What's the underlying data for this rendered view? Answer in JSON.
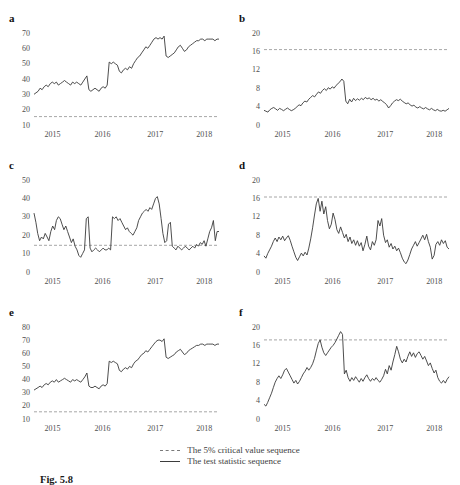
{
  "figure": {
    "x_tick_labels": [
      "2015",
      "2016",
      "2017",
      "2018"
    ],
    "x_tick_fractions": [
      0.1,
      0.37,
      0.655,
      0.92
    ],
    "legend": {
      "items": [
        {
          "style": "dashed",
          "label": "The 5% critical value sequence"
        },
        {
          "style": "solid",
          "label": "The test statistic sequence"
        }
      ]
    },
    "caption": {
      "label": "Fig. 5.8"
    },
    "colors": {
      "series": "#3a3a3a",
      "critical": "#8f8f8f",
      "tick_text": "#4f4f4f",
      "panel_label": "#111111"
    }
  },
  "chart_data": [
    {
      "type": "line",
      "label": "a",
      "x_ticks": [
        "2015",
        "2016",
        "2017",
        "2018"
      ],
      "ylim": [
        10,
        70
      ],
      "yticks": [
        10,
        20,
        30,
        40,
        50,
        60,
        70
      ],
      "critical_value": 15.5,
      "series_name": "The test statistic sequence",
      "values": [
        30,
        31,
        32,
        34,
        33,
        35,
        36,
        35,
        37,
        38,
        37,
        38,
        36,
        37,
        38,
        39,
        38,
        37,
        36,
        38,
        37,
        38,
        37,
        36,
        38,
        40,
        42,
        33,
        32,
        33,
        34,
        33,
        32,
        34,
        35,
        34,
        36,
        51,
        50,
        51,
        50,
        49,
        45,
        44,
        46,
        47,
        46,
        48,
        47,
        50,
        52,
        54,
        55,
        57,
        59,
        61,
        60,
        62,
        64,
        66,
        67,
        66,
        67,
        66,
        68,
        55,
        54,
        55,
        56,
        57,
        59,
        61,
        62,
        60,
        58,
        59,
        61,
        62,
        63,
        64,
        65,
        65,
        66,
        66,
        65,
        66,
        66,
        66,
        66,
        65,
        66,
        66
      ]
    },
    {
      "type": "line",
      "label": "b",
      "x_ticks": [
        "2015",
        "2016",
        "2017",
        "2018"
      ],
      "ylim": [
        0,
        20
      ],
      "yticks": [
        0,
        4,
        8,
        12,
        16,
        20
      ],
      "critical_value": 16.4,
      "series_name": "The test statistic sequence",
      "values": [
        3.2,
        3.0,
        2.8,
        3.3,
        3.6,
        3.8,
        3.5,
        3.2,
        3.6,
        3.4,
        3.1,
        3.4,
        3.7,
        3.4,
        3.1,
        3.3,
        3.6,
        4.0,
        4.4,
        4.2,
        4.8,
        5.2,
        5.0,
        5.6,
        6.0,
        6.4,
        6.1,
        6.7,
        7.2,
        6.9,
        7.5,
        7.9,
        7.5,
        8.1,
        7.8,
        8.3,
        8.0,
        8.6,
        9.0,
        9.4,
        10.0,
        9.5,
        5.2,
        4.6,
        5.6,
        5.0,
        5.8,
        5.3,
        5.7,
        5.4,
        5.8,
        5.5,
        6.0,
        5.7,
        5.9,
        5.5,
        5.8,
        5.4,
        5.6,
        5.2,
        5.5,
        5.1,
        4.8,
        4.4,
        3.7,
        4.2,
        4.8,
        5.2,
        5.5,
        5.3,
        5.6,
        5.2,
        4.9,
        4.6,
        4.8,
        4.4,
        4.1,
        4.3,
        3.9,
        3.7,
        4.0,
        3.7,
        3.5,
        3.8,
        3.5,
        3.3,
        3.6,
        3.3,
        3.1,
        3.4,
        3.1,
        3.0,
        3.2,
        3.0,
        3.3,
        3.6
      ]
    },
    {
      "type": "line",
      "label": "c",
      "x_ticks": [
        "2015",
        "2016",
        "2017",
        "2018"
      ],
      "ylim": [
        0,
        50
      ],
      "yticks": [
        0,
        10,
        20,
        30,
        40,
        50
      ],
      "critical_value": 14.5,
      "series_name": "The test statistic sequence",
      "values": [
        32,
        27,
        21,
        17,
        19,
        18,
        21,
        19,
        17,
        22,
        25,
        23,
        28,
        30,
        29,
        26,
        23,
        25,
        22,
        19,
        16,
        18,
        14,
        12,
        9,
        8,
        10,
        12,
        29,
        30,
        13,
        11,
        12,
        13,
        12,
        11,
        12,
        13,
        12,
        12,
        13,
        12,
        30,
        29,
        30,
        28,
        29,
        27,
        25,
        23,
        24,
        22,
        21,
        20,
        22,
        24,
        28,
        30,
        32,
        33,
        34,
        33,
        35,
        34,
        37,
        40,
        41,
        37,
        29,
        21,
        16,
        17,
        26,
        27,
        14,
        13,
        12,
        14,
        13,
        12,
        13,
        14,
        13,
        12,
        13,
        14,
        13,
        15,
        14,
        16,
        15,
        17,
        14,
        18,
        22,
        24,
        28,
        17,
        22,
        22
      ]
    },
    {
      "type": "line",
      "label": "d",
      "x_ticks": [
        "2015",
        "2016",
        "2017",
        "2018"
      ],
      "ylim": [
        0,
        20
      ],
      "yticks": [
        0,
        4,
        8,
        12,
        16,
        20
      ],
      "critical_value": 16.3,
      "series_name": "The test statistic sequence",
      "values": [
        3.5,
        3.0,
        4.0,
        4.8,
        5.6,
        6.6,
        7.4,
        6.6,
        7.6,
        7.0,
        7.8,
        6.8,
        7.4,
        7.9,
        6.9,
        5.6,
        4.4,
        3.2,
        2.5,
        3.3,
        4.1,
        3.5,
        4.3,
        3.7,
        5.2,
        7.2,
        9.6,
        12.4,
        14.8,
        16.0,
        13.2,
        15.4,
        12.6,
        14.2,
        11.2,
        9.4,
        10.4,
        12.8,
        11.4,
        9.2,
        8.4,
        9.8,
        8.6,
        7.4,
        8.2,
        6.6,
        7.6,
        6.2,
        7.0,
        5.8,
        6.8,
        5.6,
        6.4,
        4.6,
        6.0,
        7.8,
        5.6,
        4.8,
        6.6,
        5.8,
        7.0,
        11.2,
        10.0,
        11.6,
        8.0,
        6.4,
        7.0,
        5.4,
        6.2,
        5.0,
        5.6,
        4.6,
        5.2,
        4.2,
        3.0,
        2.2,
        1.8,
        2.6,
        3.8,
        5.0,
        5.8,
        6.6,
        5.6,
        6.4,
        7.2,
        8.0,
        7.0,
        8.2,
        6.6,
        5.4,
        2.8,
        3.6,
        6.0,
        6.6,
        5.8,
        7.0,
        6.2,
        6.8,
        5.4,
        5.0
      ]
    },
    {
      "type": "line",
      "label": "e",
      "x_ticks": [
        "2015",
        "2016",
        "2017",
        "2018"
      ],
      "ylim": [
        10,
        80
      ],
      "yticks": [
        10,
        20,
        30,
        40,
        50,
        60,
        70,
        80
      ],
      "critical_value": 15.5,
      "series_name": "The test statistic sequence",
      "values": [
        32,
        33,
        34,
        35,
        34,
        36,
        37,
        36,
        38,
        39,
        38,
        40,
        38,
        39,
        40,
        41,
        40,
        39,
        38,
        40,
        39,
        40,
        39,
        38,
        40,
        42,
        45,
        35,
        34,
        34,
        35,
        34,
        33,
        35,
        36,
        35,
        37,
        54,
        53,
        54,
        53,
        52,
        47,
        46,
        48,
        49,
        48,
        50,
        49,
        52,
        54,
        55,
        57,
        59,
        60,
        62,
        61,
        63,
        65,
        67,
        69,
        70,
        70,
        69,
        71,
        57,
        56,
        57,
        58,
        59,
        61,
        62,
        63,
        61,
        59,
        60,
        62,
        63,
        64,
        65,
        66,
        66,
        67,
        67,
        66,
        67,
        67,
        67,
        67,
        66,
        67,
        67
      ]
    },
    {
      "type": "line",
      "label": "f",
      "x_ticks": [
        "2015",
        "2016",
        "2017",
        "2018"
      ],
      "ylim": [
        0,
        20
      ],
      "yticks": [
        0,
        4,
        8,
        12,
        16,
        20
      ],
      "critical_value": 17.2,
      "series_name": "The test statistic sequence",
      "values": [
        3.2,
        2.8,
        3.6,
        4.6,
        5.6,
        6.8,
        8.0,
        8.8,
        9.4,
        8.8,
        9.6,
        10.6,
        11.0,
        10.2,
        9.4,
        8.6,
        7.8,
        8.4,
        7.6,
        8.2,
        9.0,
        9.8,
        10.4,
        11.2,
        10.6,
        11.2,
        12.0,
        13.2,
        14.8,
        16.4,
        17.2,
        15.6,
        14.4,
        13.8,
        14.4,
        15.0,
        15.6,
        16.0,
        16.6,
        17.4,
        18.2,
        19.0,
        18.4,
        9.8,
        10.6,
        9.0,
        8.2,
        9.0,
        8.4,
        9.2,
        8.6,
        8.0,
        8.8,
        8.2,
        9.0,
        9.6,
        8.8,
        8.2,
        8.8,
        8.4,
        9.0,
        8.4,
        8.0,
        8.6,
        9.4,
        10.8,
        9.8,
        11.6,
        10.6,
        12.4,
        14.0,
        15.8,
        14.6,
        13.0,
        12.2,
        13.0,
        12.4,
        13.6,
        14.6,
        13.6,
        14.4,
        13.4,
        14.2,
        14.6,
        13.8,
        13.0,
        13.6,
        12.6,
        11.6,
        12.2,
        11.0,
        10.0,
        10.6,
        9.0,
        8.2,
        7.8,
        8.4,
        7.8,
        8.6,
        9.2
      ]
    }
  ]
}
